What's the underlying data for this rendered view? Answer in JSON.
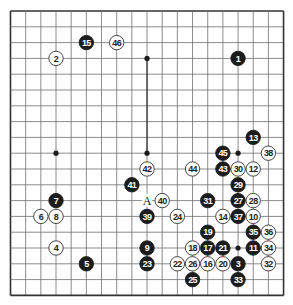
{
  "diagram": {
    "type": "go-board",
    "size": 19,
    "colors": {
      "background": "#ffffff",
      "line": "#6f6f6f",
      "border": "#333333",
      "highlight_line": "#222222",
      "black_stone": "#1c1c1c",
      "black_text": "#ffffff",
      "white_stone": "#ffffff",
      "white_text": "#222222"
    },
    "star_points": [
      [
        3,
        3
      ],
      [
        9,
        3
      ],
      [
        15,
        3
      ],
      [
        3,
        9
      ],
      [
        9,
        9
      ],
      [
        15,
        9
      ],
      [
        3,
        15
      ],
      [
        9,
        15
      ],
      [
        15,
        15
      ]
    ],
    "visible_star_points": [
      [
        9,
        3
      ],
      [
        3,
        9
      ],
      [
        9,
        9
      ],
      [
        15,
        9
      ],
      [
        15,
        15
      ]
    ],
    "stones": [
      {
        "n": "1",
        "color": "black",
        "col": 15,
        "row": 3
      },
      {
        "n": "2",
        "color": "white",
        "col": 3,
        "row": 3
      },
      {
        "n": "3",
        "color": "black",
        "col": 15,
        "row": 16
      },
      {
        "n": "4",
        "color": "white",
        "col": 3,
        "row": 15
      },
      {
        "n": "5",
        "color": "black",
        "col": 5,
        "row": 16
      },
      {
        "n": "6",
        "color": "white",
        "col": 2,
        "row": 13
      },
      {
        "n": "7",
        "color": "black",
        "col": 3,
        "row": 12
      },
      {
        "n": "8",
        "color": "white",
        "col": 3,
        "row": 13
      },
      {
        "n": "9",
        "color": "black",
        "col": 9,
        "row": 15
      },
      {
        "n": "10",
        "color": "white",
        "col": 16,
        "row": 13
      },
      {
        "n": "11",
        "color": "black",
        "col": 16,
        "row": 15
      },
      {
        "n": "12",
        "color": "white",
        "col": 16,
        "row": 10
      },
      {
        "n": "13",
        "color": "black",
        "col": 16,
        "row": 8
      },
      {
        "n": "14",
        "color": "white",
        "col": 14,
        "row": 13
      },
      {
        "n": "15",
        "color": "black",
        "col": 5,
        "row": 2
      },
      {
        "n": "16",
        "color": "white",
        "col": 13,
        "row": 16
      },
      {
        "n": "17",
        "color": "black",
        "col": 13,
        "row": 15
      },
      {
        "n": "18",
        "color": "white",
        "col": 12,
        "row": 15
      },
      {
        "n": "19",
        "color": "black",
        "col": 13,
        "row": 14
      },
      {
        "n": "20",
        "color": "white",
        "col": 14,
        "row": 16
      },
      {
        "n": "21",
        "color": "black",
        "col": 14,
        "row": 15
      },
      {
        "n": "22",
        "color": "white",
        "col": 11,
        "row": 16
      },
      {
        "n": "23",
        "color": "black",
        "col": 9,
        "row": 16
      },
      {
        "n": "24",
        "color": "white",
        "col": 11,
        "row": 13
      },
      {
        "n": "25",
        "color": "black",
        "col": 12,
        "row": 17
      },
      {
        "n": "26",
        "color": "white",
        "col": 12,
        "row": 16
      },
      {
        "n": "27",
        "color": "black",
        "col": 15,
        "row": 12
      },
      {
        "n": "28",
        "color": "white",
        "col": 16,
        "row": 12
      },
      {
        "n": "29",
        "color": "black",
        "col": 15,
        "row": 11
      },
      {
        "n": "30",
        "color": "white",
        "col": 15,
        "row": 10
      },
      {
        "n": "31",
        "color": "black",
        "col": 13,
        "row": 12
      },
      {
        "n": "32",
        "color": "white",
        "col": 17,
        "row": 16
      },
      {
        "n": "33",
        "color": "black",
        "col": 15,
        "row": 17
      },
      {
        "n": "34",
        "color": "white",
        "col": 17,
        "row": 15
      },
      {
        "n": "35",
        "color": "black",
        "col": 16,
        "row": 14
      },
      {
        "n": "36",
        "color": "white",
        "col": 17,
        "row": 14
      },
      {
        "n": "37",
        "color": "black",
        "col": 15,
        "row": 13
      },
      {
        "n": "38",
        "color": "white",
        "col": 17,
        "row": 9
      },
      {
        "n": "39",
        "color": "black",
        "col": 9,
        "row": 13
      },
      {
        "n": "40",
        "color": "white",
        "col": 10,
        "row": 12
      },
      {
        "n": "41",
        "color": "black",
        "col": 8,
        "row": 11
      },
      {
        "n": "42",
        "color": "white",
        "col": 9,
        "row": 10
      },
      {
        "n": "43",
        "color": "black",
        "col": 14,
        "row": 10
      },
      {
        "n": "44",
        "color": "white",
        "col": 12,
        "row": 10
      },
      {
        "n": "45",
        "color": "black",
        "col": 14,
        "row": 9
      },
      {
        "n": "46",
        "color": "white",
        "col": 7,
        "row": 2
      }
    ],
    "markers": [
      {
        "label": "A",
        "col": 9,
        "row": 12
      }
    ]
  }
}
